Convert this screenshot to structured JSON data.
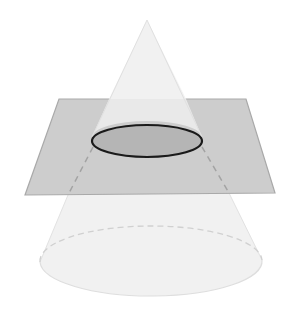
{
  "diagram": {
    "type": "cone-plane-cross-section",
    "colors": {
      "background": "#ffffff",
      "cone_fill": "#f0f0f0",
      "cone_edge": "#dcdcdc",
      "plane_fill": "#c8c8c8",
      "plane_edge": "#a8a8a8",
      "section_fill": "#b4b4b4",
      "section_stroke": "#1a1a1a",
      "hidden_line": "#a0a0a0",
      "base_hidden_line": "#cfcfcf"
    },
    "shapes": {
      "cone": {
        "apex": [
          147,
          20
        ],
        "base_center": [
          151,
          260
        ],
        "base_rx": 111,
        "base_ry": 35
      },
      "plane": {
        "corners": [
          [
            59,
            99
          ],
          [
            246,
            99
          ],
          [
            275,
            193
          ],
          [
            25,
            195
          ]
        ]
      },
      "cross_section": {
        "center": [
          147,
          141
        ],
        "rx": 55,
        "ry": 16
      }
    }
  }
}
